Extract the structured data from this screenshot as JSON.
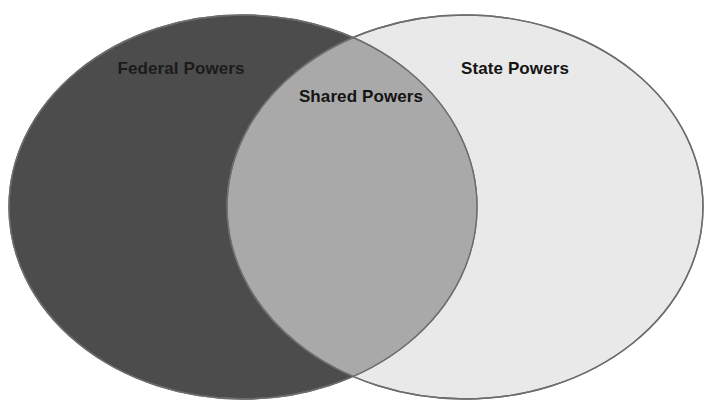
{
  "diagram": {
    "type": "venn",
    "set_count": 2,
    "background_color": "#ffffff",
    "canvas": {
      "width": 714,
      "height": 409
    },
    "outline_color": "#6d6d6d",
    "sets": [
      {
        "id": "federal",
        "label": "Federal Powers",
        "fill_color": "#4c4c4c",
        "label_color": "#1b1b1b",
        "center": {
          "x": 243,
          "y": 207
        },
        "radius_x": 234,
        "radius_y": 192
      },
      {
        "id": "state",
        "label": "State Powers",
        "fill_color": "#e9e9e9",
        "label_color": "#141414",
        "center": {
          "x": 465,
          "y": 207
        },
        "radius_x": 238,
        "radius_y": 192
      }
    ],
    "intersection": {
      "id": "shared",
      "label": "Shared Powers",
      "fill_color": "#a9a9a9",
      "label_color": "#141414",
      "left_edge_x": 227,
      "right_edge_x": 477
    },
    "labels": {
      "left": "Federal Powers",
      "overlap": "Shared Powers",
      "right": "State Powers"
    },
    "top_clipped_text": ""
  }
}
